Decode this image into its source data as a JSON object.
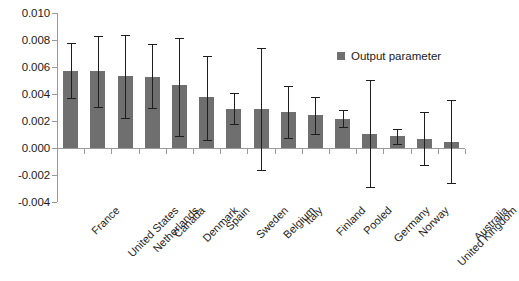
{
  "chart_data": {
    "type": "bar",
    "title": "",
    "subtitle": "",
    "xlabel": "",
    "ylabel": "",
    "ylim": [
      -0.004,
      0.01
    ],
    "ytick_labels": [
      "0.010",
      "0.008",
      "0.006",
      "0.004",
      "0.002",
      "0.000",
      "-0.002",
      "-0.004"
    ],
    "ytick_values": [
      0.01,
      0.008,
      0.006,
      0.004,
      0.002,
      0.0,
      -0.002,
      -0.004
    ],
    "grid": false,
    "legend_position": "upper-right",
    "legend": [
      "Output parameter"
    ],
    "error_bars": true,
    "bar_color": "#6f6f6f",
    "error_bar_color": "#1e1e1e",
    "axis_color": "#9a9a9a",
    "categories": [
      "France",
      "United States",
      "Netherlands",
      "Canada",
      "Denmark",
      "Spain",
      "Sweden",
      "Belgium",
      "Italy",
      "Finland",
      "Pooled",
      "Germany",
      "Norway",
      "United Kingdom",
      "Australia"
    ],
    "series": [
      {
        "name": "Output parameter",
        "values": [
          0.00573,
          0.00568,
          0.00533,
          0.00525,
          0.00467,
          0.00376,
          0.00292,
          0.00289,
          0.00268,
          0.00241,
          0.00215,
          0.00107,
          0.00086,
          0.0007,
          0.00045
        ],
        "err_low": [
          0.00367,
          0.00301,
          0.00224,
          0.00293,
          0.00091,
          0.00062,
          0.00176,
          -0.00164,
          0.00073,
          0.00104,
          0.00152,
          -0.00287,
          0.00032,
          -0.00127,
          -0.00259
        ],
        "err_high": [
          0.00778,
          0.00828,
          0.00834,
          0.00768,
          0.00812,
          0.00682,
          0.00408,
          0.00743,
          0.00462,
          0.00378,
          0.00281,
          0.00502,
          0.00141,
          0.00266,
          0.00353
        ]
      }
    ]
  }
}
